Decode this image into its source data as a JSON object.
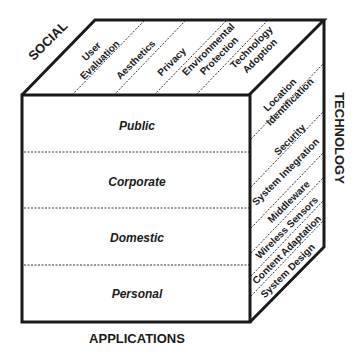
{
  "diagram": {
    "axes": {
      "social": "SOCIAL",
      "technology": "TECHNOLOGY",
      "applications": "APPLICATIONS"
    },
    "front_face": {
      "rows": [
        "Public",
        "Corporate",
        "Domestic",
        "Personal"
      ]
    },
    "top_face": {
      "items": [
        [
          "User",
          "Evaluation"
        ],
        [
          "Aesthetics"
        ],
        [
          "Privacy"
        ],
        [
          "Environmental",
          "Protection"
        ],
        [
          "Technology",
          "Adoption"
        ]
      ]
    },
    "right_face": {
      "items": [
        [
          "Location",
          "Identification"
        ],
        [
          "Security"
        ],
        [
          "System Integration"
        ],
        [
          "Middleware"
        ],
        [
          "Wireless Sensors"
        ],
        [
          "Content Adaptation"
        ],
        [
          "System Design"
        ]
      ]
    },
    "colors": {
      "stroke": "#1a1a1a",
      "background": "#ffffff"
    }
  }
}
